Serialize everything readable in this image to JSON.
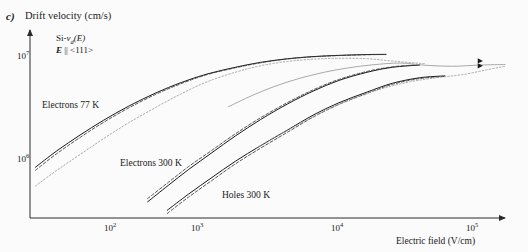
{
  "figure": {
    "panel_letter": "c)",
    "y_axis_title": "Drift velocity (cm/s)",
    "x_axis_title": "Electric field (V/cm)"
  },
  "annotation": {
    "line1_prefix": "Si-",
    "line1_v": "v",
    "line1_sub": "d",
    "line1_suffix": "(E)",
    "line2_e": "E",
    "line2_rest": " || <111>"
  },
  "curve_labels": {
    "electrons_77k": "Electrons 77 K",
    "electrons_300k": "Electrons 300 K",
    "holes_300k": "Holes 300 K"
  },
  "ticks": {
    "y": [
      {
        "mantissa": "10",
        "exponent": "7"
      },
      {
        "mantissa": "10",
        "exponent": "6"
      }
    ],
    "x": [
      {
        "mantissa": "10",
        "exponent": "2"
      },
      {
        "mantissa": "10",
        "exponent": "3"
      },
      {
        "mantissa": "10",
        "exponent": "4"
      },
      {
        "mantissa": "10",
        "exponent": "5"
      }
    ]
  },
  "colors": {
    "background": "#fbfbfb",
    "axis": "#2a2a2a",
    "curve_solid": "#1a1a1a",
    "curve_dashed": "#3a3a3a",
    "curve_light": "#9a9a9a",
    "text": "#1a1a1a"
  },
  "chart_data": {
    "type": "line",
    "xlabel": "Electric field (V/cm)",
    "ylabel": "Drift velocity (cm/s)",
    "xscale": "log",
    "yscale": "log",
    "xlim": [
      50,
      200000
    ],
    "ylim": [
      400000,
      20000000
    ],
    "xticks": [
      100,
      1000,
      10000,
      100000
    ],
    "yticks": [
      1000000,
      10000000
    ],
    "grid": false,
    "legend": "inline-annotations",
    "series": [
      {
        "name": "Electrons 77 K",
        "style": "solid",
        "x": [
          55,
          80,
          120,
          180,
          280,
          450,
          700,
          1100,
          1800,
          2800,
          4500,
          7000,
          11000,
          18000,
          25000
        ],
        "y": [
          1150000,
          1620000,
          2250000,
          3050000,
          4100000,
          5400000,
          6700000,
          8000000,
          9200000,
          10200000,
          11000000,
          11500000,
          11800000,
          12000000,
          12050000
        ]
      },
      {
        "name": "Electrons 77 K (model A, dashed)",
        "style": "dashed",
        "x": [
          55,
          80,
          120,
          180,
          280,
          450,
          700,
          1100,
          1800,
          2800,
          4500,
          7000,
          11000,
          18000,
          25000
        ],
        "y": [
          1080000,
          1530000,
          2140000,
          2920000,
          3950000,
          5250000,
          6550000,
          7900000,
          9100000,
          10100000,
          10950000,
          11450000,
          11750000,
          11950000,
          12000000
        ]
      },
      {
        "name": "Electrons 77 K (model B, dotted light)",
        "style": "dotted-light",
        "x": [
          55,
          80,
          120,
          180,
          280,
          450,
          700,
          1100,
          1800,
          2800,
          4500,
          7000,
          11000,
          18000,
          30000,
          50000
        ],
        "y": [
          780000,
          1080000,
          1500000,
          2080000,
          2900000,
          4000000,
          5300000,
          6800000,
          8300000,
          9500000,
          10400000,
          10900000,
          11100000,
          11000000,
          10400000,
          9900000
        ]
      },
      {
        "name": "Electrons 300 K",
        "style": "solid",
        "x": [
          390,
          560,
          800,
          1200,
          1800,
          2800,
          4500,
          7000,
          11000,
          18000,
          28000,
          45000
        ],
        "y": [
          560000,
          790000,
          1100000,
          1560000,
          2200000,
          3100000,
          4300000,
          5600000,
          7000000,
          8300000,
          9200000,
          9650000
        ]
      },
      {
        "name": "Electrons 300 K (model A, dashed)",
        "style": "dashed",
        "x": [
          390,
          560,
          800,
          1200,
          1800,
          2800,
          4500,
          7000,
          11000,
          18000,
          28000,
          45000
        ],
        "y": [
          600000,
          840000,
          1170000,
          1640000,
          2300000,
          3220000,
          4430000,
          5750000,
          7150000,
          8450000,
          9300000,
          9700000
        ]
      },
      {
        "name": "Electrons 300 K (model B, light)",
        "style": "solid-light",
        "x": [
          1600,
          2400,
          3600,
          5500,
          8500,
          13000,
          20000,
          32000,
          50000,
          80000,
          130000,
          200000
        ],
        "y": [
          4050000,
          5100000,
          6200000,
          7300000,
          8300000,
          9100000,
          9700000,
          10050000,
          9600000,
          9400000,
          9650000,
          9750000
        ]
      },
      {
        "name": "Holes 300 K",
        "style": "solid",
        "x": [
          550,
          800,
          1200,
          1800,
          2800,
          4500,
          7000,
          11000,
          18000,
          28000,
          45000,
          70000
        ],
        "y": [
          470000,
          660000,
          930000,
          1300000,
          1800000,
          2500000,
          3400000,
          4400000,
          5500000,
          6600000,
          7400000,
          7700000
        ]
      },
      {
        "name": "Holes 300 K (model A, dashed)",
        "style": "dashed",
        "x": [
          550,
          800,
          1200,
          1800,
          2800,
          4500,
          7000,
          11000,
          18000,
          28000,
          45000,
          70000
        ],
        "y": [
          440000,
          620000,
          875000,
          1230000,
          1710000,
          2390000,
          3260000,
          4250000,
          5350000,
          6450000,
          7280000,
          7620000
        ]
      },
      {
        "name": "Holes 300 K (model B, light)",
        "style": "dotted-light",
        "x": [
          2600,
          4000,
          6200,
          9500,
          15000,
          24000,
          38000,
          60000,
          95000,
          150000,
          200000
        ],
        "y": [
          1700000,
          2300000,
          3050000,
          3950000,
          4950000,
          5950000,
          6800000,
          7400000,
          7900000,
          8800000,
          9400000
        ]
      }
    ],
    "markers": [
      {
        "name": "saturation-marker-upper",
        "x": 130000,
        "y": 10500000
      },
      {
        "name": "saturation-marker-lower",
        "x": 130000,
        "y": 9500000
      }
    ]
  }
}
